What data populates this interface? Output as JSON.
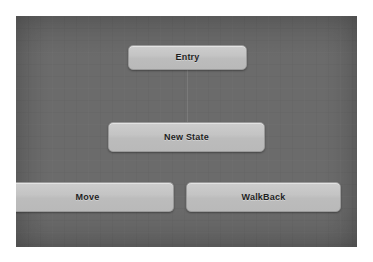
{
  "canvas": {
    "background_color": "#6b6b6b",
    "node_fill_color": "#c4c4c4",
    "node_border_color": "#9a9a9a",
    "node_text_color": "#1f1f1f"
  },
  "nodes": [
    {
      "id": "entry",
      "label": "Entry"
    },
    {
      "id": "new-state",
      "label": "New State"
    },
    {
      "id": "move",
      "label": "Move"
    },
    {
      "id": "walkback",
      "label": "WalkBack"
    }
  ]
}
